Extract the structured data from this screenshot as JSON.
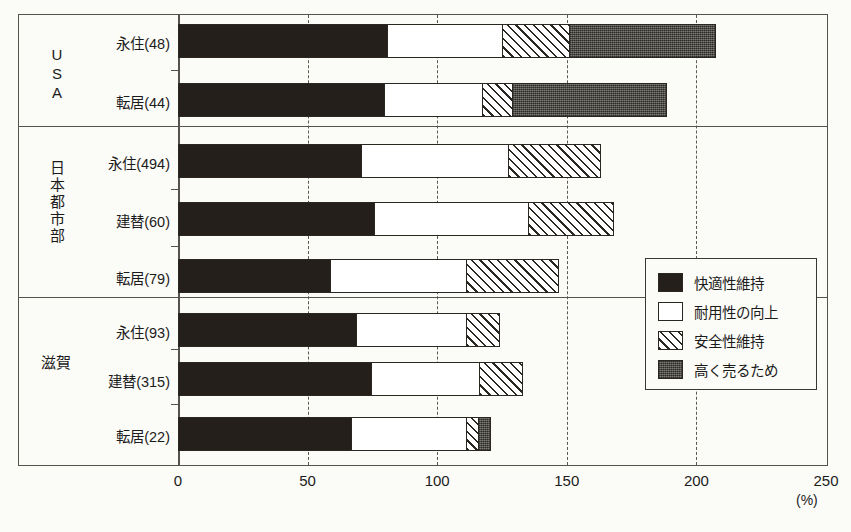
{
  "chart_data": {
    "type": "bar",
    "orientation": "horizontal",
    "stacked": true,
    "title": "",
    "xlabel": "(%)",
    "ylabel": "",
    "xlim": [
      0,
      250
    ],
    "xticks": [
      "0",
      "50",
      "100",
      "150",
      "200",
      "250"
    ],
    "unit": "(%)",
    "grid": "vertical dashed at 50,100,150,200",
    "legend_position": "inside-right",
    "series": [
      {
        "name": "快適性維持",
        "key": "comfort",
        "pattern": "solid-black",
        "color": "#241f1a"
      },
      {
        "name": "耐用性の向上",
        "key": "durability",
        "pattern": "white",
        "color": "#ffffff"
      },
      {
        "name": "安全性維持",
        "key": "safety",
        "pattern": "diagonal-hatch",
        "color": "#ffffff"
      },
      {
        "name": "高く売るため",
        "key": "resale",
        "pattern": "dotted-gray",
        "color": "#595750"
      }
    ],
    "groups": [
      {
        "name": "USA",
        "vertical_label": true,
        "rows": [
          {
            "label": "永住(48)",
            "values": {
              "comfort": 81,
              "durability": 45,
              "safety": 26,
              "resale": 57
            },
            "total": 209
          },
          {
            "label": "転居(44)",
            "values": {
              "comfort": 80,
              "durability": 38,
              "safety": 12,
              "resale": 60
            },
            "total": 190
          }
        ]
      },
      {
        "name": "日本都市部",
        "vertical_label": true,
        "rows": [
          {
            "label": "永住(494)",
            "values": {
              "comfort": 71,
              "durability": 57,
              "safety": 36,
              "resale": 0
            },
            "total": 164
          },
          {
            "label": "建替(60)",
            "values": {
              "comfort": 76,
              "durability": 60,
              "safety": 33,
              "resale": 0
            },
            "total": 169
          },
          {
            "label": "転居(79)",
            "values": {
              "comfort": 59,
              "durability": 53,
              "safety": 36,
              "resale": 0
            },
            "total": 148
          }
        ]
      },
      {
        "name": "滋賀",
        "vertical_label": false,
        "rows": [
          {
            "label": "永住(93)",
            "values": {
              "comfort": 69,
              "durability": 43,
              "safety": 13,
              "resale": 0
            },
            "total": 125
          },
          {
            "label": "建替(315)",
            "values": {
              "comfort": 75,
              "durability": 42,
              "safety": 17,
              "resale": 0
            },
            "total": 134
          },
          {
            "label": "転居(22)",
            "values": {
              "comfort": 67,
              "durability": 45,
              "safety": 5,
              "resale": 5
            },
            "total": 122
          }
        ]
      }
    ]
  },
  "axis": {
    "ticks": [
      {
        "label": "0",
        "value": 0
      },
      {
        "label": "50",
        "value": 50
      },
      {
        "label": "100",
        "value": 100
      },
      {
        "label": "150",
        "value": 150
      },
      {
        "label": "200",
        "value": 200
      },
      {
        "label": "250",
        "value": 250
      }
    ],
    "unit_label": "(%)"
  },
  "legend": {
    "items": [
      {
        "label": "快適性維持",
        "swatch": "black-swatch"
      },
      {
        "label": "耐用性の向上",
        "swatch": "white-swatch"
      },
      {
        "label": "安全性維持",
        "swatch": "hatched-swatch"
      },
      {
        "label": "高く売るため",
        "swatch": "gray-swatch"
      }
    ]
  },
  "groups_flat": {
    "usa": "USA",
    "japan_urban": "日本都市部",
    "shiga": "滋賀"
  }
}
